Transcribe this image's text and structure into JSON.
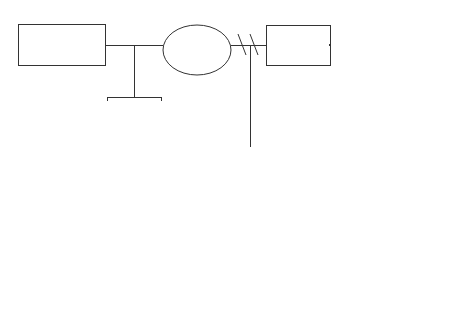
{
  "diagram": {
    "type": "family-tree / genogram",
    "annotation": "divorce",
    "unknown_marker": "?",
    "people": {
      "step_father": {
        "line1": "Step-Father, Bill",
        "line2": "Age 95",
        "shape": "box"
      },
      "mother": {
        "line1": "Mother",
        "line2": "(deceased)",
        "shape": "ellipse"
      },
      "father": {
        "line1": "Father",
        "line2": "(deceased)",
        "shape": "box"
      },
      "step_mother": {
        "line1": "Step-Mother,",
        "line2": "Barbara",
        "shape": "ellipse"
      },
      "judie": {
        "name": "Judie",
        "suffix": ",",
        "line2": "age 74",
        "shape": "ellipse"
      },
      "thomas": {
        "line1": "Thomas",
        "line2": "(deceased)",
        "shape": "box"
      },
      "jessica": {
        "line1": "Jessica",
        "shape": "ellipse"
      },
      "thomas_jr": {
        "line1": "Thomas, Jr.",
        "shape": "box"
      },
      "karen": {
        "line1": "Karen",
        "shape": "ellipse"
      },
      "cloe": {
        "line1": "Cloe",
        "shape": "ellipse"
      }
    },
    "unknown_children": {
      "step_father_mother": [
        "?",
        "?"
      ],
      "father_step_mother": [
        "?",
        "?",
        "?"
      ]
    }
  }
}
